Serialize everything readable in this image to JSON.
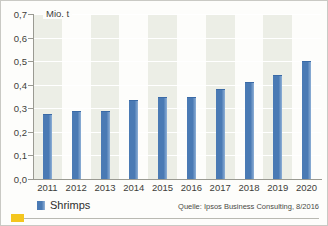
{
  "chart_data": {
    "type": "bar",
    "title": "",
    "subtitle": "",
    "unit_label": "Mio. t",
    "xlabel": "",
    "ylabel": "Mio. t",
    "ylim": [
      0,
      0.7
    ],
    "ytick_labels": [
      "0,7",
      "0,6",
      "0,5",
      "0,4",
      "0,3",
      "0,2",
      "0,1",
      "0,0"
    ],
    "ytick_values": [
      0.7,
      0.6,
      0.5,
      0.4,
      0.3,
      0.2,
      0.1,
      0.0
    ],
    "grid": true,
    "legend_position": "bottom-left",
    "categories": [
      "2011",
      "2012",
      "2013",
      "2014",
      "2015",
      "2016",
      "2017",
      "2018",
      "2019",
      "2020"
    ],
    "series": [
      {
        "name": "Shrimps",
        "color": "#4a7ab4",
        "values": [
          0.275,
          0.29,
          0.29,
          0.335,
          0.35,
          0.35,
          0.38,
          0.41,
          0.44,
          0.5
        ]
      }
    ],
    "source": "Quelle: Ipsos Business Consulting, 8/2016"
  },
  "legend": {
    "label": "Shrimps"
  },
  "colors": {
    "bar": "#4a7ab4",
    "bar_highlight": "#8fb0d6",
    "band": "#eceee6",
    "axis": "#9a9a92",
    "accent": "#f4c61e",
    "text": "#3d3d3a"
  }
}
